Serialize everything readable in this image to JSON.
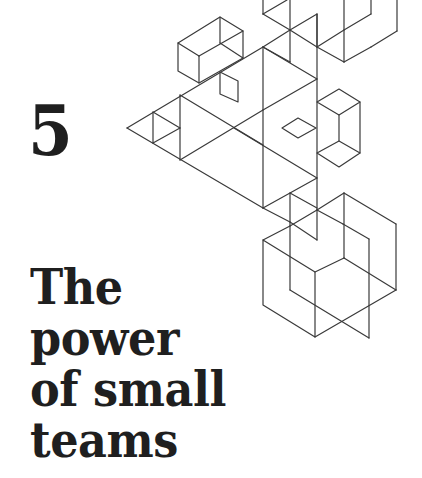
{
  "chapter": {
    "number": "5",
    "title_lines": [
      "The",
      "power",
      "of small",
      "teams"
    ]
  },
  "illustration": {
    "name": "isometric-wireframe-cubes-and-triangles",
    "stroke_color": "#3a3a3a"
  },
  "colors": {
    "background": "#ffffff",
    "text": "#1f1f1f"
  }
}
